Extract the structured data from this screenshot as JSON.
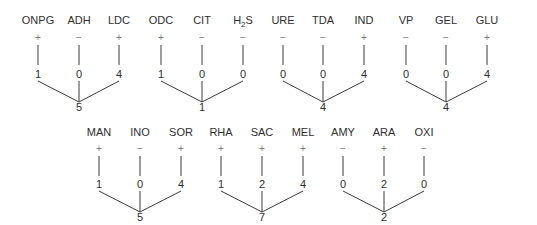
{
  "diagram": {
    "title": "",
    "colors": {
      "text": "#2e2e2e",
      "sign": "#7a7a7a",
      "line": "#3a3a3a"
    },
    "rows": [
      {
        "groups": [
          {
            "tests": [
              {
                "label": "ONPG",
                "sign": "+",
                "score": "1"
              },
              {
                "label": "ADH",
                "sign": "−",
                "score": "0"
              },
              {
                "label": "LDC",
                "sign": "+",
                "score": "4"
              }
            ],
            "sum": "5"
          },
          {
            "tests": [
              {
                "label": "ODC",
                "sign": "+",
                "score": "1"
              },
              {
                "label": "CIT",
                "sign": "−",
                "score": "0"
              },
              {
                "label": "H",
                "label_sub": "2",
                "label_tail": "S",
                "sign": "−",
                "score": "0"
              }
            ],
            "sum": "1"
          },
          {
            "tests": [
              {
                "label": "URE",
                "sign": "−",
                "score": "0"
              },
              {
                "label": "TDA",
                "sign": "−",
                "score": "0"
              },
              {
                "label": "IND",
                "sign": "+",
                "score": "4"
              }
            ],
            "sum": "4"
          },
          {
            "tests": [
              {
                "label": "VP",
                "sign": "−",
                "score": "0"
              },
              {
                "label": "GEL",
                "sign": "−",
                "score": "0"
              },
              {
                "label": "GLU",
                "sign": "+",
                "score": "4"
              }
            ],
            "sum": "4"
          }
        ]
      },
      {
        "groups": [
          {
            "tests": [
              {
                "label": "MAN",
                "sign": "+",
                "score": "1"
              },
              {
                "label": "INO",
                "sign": "−",
                "score": "0"
              },
              {
                "label": "SOR",
                "sign": "+",
                "score": "4"
              }
            ],
            "sum": "5"
          },
          {
            "tests": [
              {
                "label": "RHA",
                "sign": "+",
                "score": "1"
              },
              {
                "label": "SAC",
                "sign": "+",
                "score": "2"
              },
              {
                "label": "MEL",
                "sign": "+",
                "score": "4"
              }
            ],
            "sum": "7"
          },
          {
            "tests": [
              {
                "label": "AMY",
                "sign": "−",
                "score": "0"
              },
              {
                "label": "ARA",
                "sign": "+",
                "score": "2"
              },
              {
                "label": "OXI",
                "sign": "−",
                "score": "0"
              }
            ],
            "sum": "2"
          }
        ]
      }
    ]
  }
}
